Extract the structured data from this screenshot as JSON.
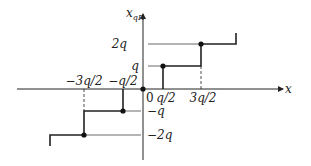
{
  "diagram": {
    "type": "quantizer-staircase",
    "axes": {
      "x_label": "x",
      "y_label": "x",
      "y_label_subscript": "qR",
      "origin_label": "0"
    },
    "x_ticks": [
      {
        "label": "−3q/2",
        "value": -1.5
      },
      {
        "label": "−q/2",
        "value": -0.5
      },
      {
        "label": "q/2",
        "value": 0.5
      },
      {
        "label": "3q/2",
        "value": 1.5
      }
    ],
    "y_ticks": [
      {
        "label": "2q",
        "value": 2
      },
      {
        "label": "q",
        "value": 1
      },
      {
        "label": "−q",
        "value": -1
      },
      {
        "label": "−2q",
        "value": -2
      }
    ],
    "steps": [
      {
        "from": -2.2,
        "to": -1.5,
        "level": -2
      },
      {
        "from": -1.5,
        "to": -0.5,
        "level": -1
      },
      {
        "from": -0.5,
        "to": 0.5,
        "level": 0
      },
      {
        "from": 0.5,
        "to": 1.5,
        "level": 1
      },
      {
        "from": 1.5,
        "to": 2.4,
        "level": 2
      }
    ],
    "colors": {
      "line": "#222222",
      "guide": "#444444",
      "background": "#ffffff"
    }
  }
}
